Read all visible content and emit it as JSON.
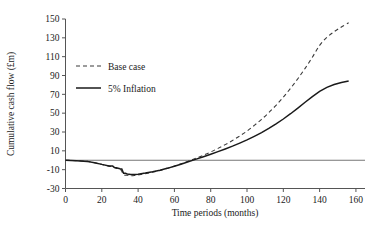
{
  "chart_data": {
    "type": "line",
    "title": "",
    "xlabel": "Time periods (months)",
    "ylabel": "Cumulative cash flow (£m)",
    "xlim": [
      0,
      165
    ],
    "ylim": [
      -30,
      150
    ],
    "xticks": [
      0,
      20,
      40,
      60,
      80,
      100,
      120,
      140,
      160
    ],
    "yticks": [
      -30,
      -10,
      10,
      30,
      50,
      70,
      90,
      110,
      130,
      150
    ],
    "xtick_labels": [
      "0",
      "20",
      "40",
      "60",
      "80",
      "100",
      "120",
      "140",
      "160"
    ],
    "ytick_labels": [
      "-30",
      "-10",
      "10",
      "30",
      "50",
      "70",
      "90",
      "110",
      "130",
      "150"
    ],
    "grid": false,
    "zero_line": 0,
    "legend_position": "upper-left-inside",
    "series": [
      {
        "name": "Base case",
        "style": "dashed",
        "color": "#3a3a3a",
        "x": [
          0,
          6,
          12,
          16,
          20,
          24,
          26,
          28,
          30,
          31,
          32,
          34,
          36,
          38,
          40,
          44,
          48,
          52,
          56,
          60,
          64,
          68,
          72,
          76,
          80,
          84,
          88,
          92,
          96,
          100,
          104,
          108,
          112,
          116,
          120,
          124,
          128,
          132,
          136,
          140,
          144,
          148,
          152,
          156
        ],
        "y": [
          0,
          -0.4,
          -1.2,
          -2.6,
          -4.4,
          -6.2,
          -7.0,
          -8.6,
          -9.2,
          -11.6,
          -15.2,
          -16.0,
          -16.4,
          -16.2,
          -15.6,
          -14.2,
          -12.6,
          -10.8,
          -8.6,
          -6.2,
          -3.6,
          -0.8,
          2.2,
          5.4,
          8.8,
          12.6,
          16.6,
          21.0,
          25.8,
          31.0,
          37.0,
          43.4,
          50.6,
          58.4,
          67.0,
          76.4,
          86.6,
          97.6,
          109.4,
          122.0,
          130.5,
          136.5,
          141.5,
          146.0
        ]
      },
      {
        "name": "5% Inflation",
        "style": "solid",
        "color": "#1a1a1a",
        "x": [
          0,
          6,
          12,
          16,
          20,
          24,
          26,
          27,
          28,
          30,
          31,
          32,
          33,
          34,
          36,
          38,
          40,
          44,
          48,
          52,
          56,
          60,
          64,
          68,
          72,
          76,
          80,
          84,
          88,
          92,
          96,
          100,
          104,
          108,
          112,
          116,
          120,
          124,
          128,
          132,
          136,
          140,
          144,
          148,
          152,
          156
        ],
        "y": [
          0,
          -0.4,
          -1.2,
          -2.6,
          -4.4,
          -6.0,
          -6.2,
          -7.8,
          -8.0,
          -9.0,
          -9.2,
          -13.8,
          -13.8,
          -14.6,
          -15.2,
          -15.2,
          -14.8,
          -13.6,
          -12.2,
          -10.6,
          -8.6,
          -6.4,
          -4.0,
          -1.4,
          1.2,
          3.8,
          6.4,
          9.2,
          12.0,
          15.0,
          18.2,
          21.6,
          25.4,
          29.4,
          33.8,
          38.6,
          43.8,
          49.4,
          55.4,
          61.6,
          67.6,
          73.2,
          77.4,
          80.4,
          82.6,
          84.2
        ]
      }
    ]
  },
  "figure": {
    "background_color": "#ffffff",
    "axis_color": "#555555",
    "text_color": "#1a1a1a"
  }
}
